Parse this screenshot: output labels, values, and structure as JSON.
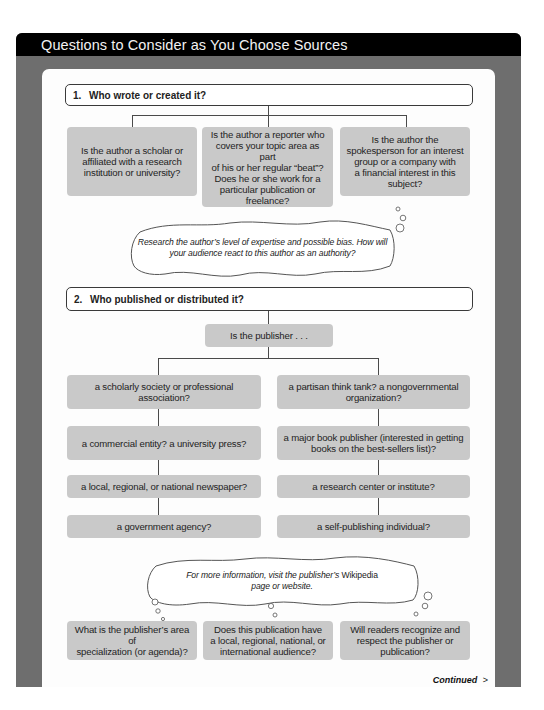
{
  "header": {
    "title": "Questions to Consider as You Choose Sources"
  },
  "section1": {
    "number": "1.",
    "title": "Who wrote or created it?",
    "questions": [
      "Is the author a scholar or\naffiliated with a research\ninstitution or university?",
      "Is the author a reporter who\ncovers your topic area as part\nof his or her regular “beat”?\nDoes he or she work for a\nparticular publication or\nfreelance?",
      "Is the author the\nspokesperson for an interest\ngroup or a company with\na financial interest in this\nsubject?"
    ],
    "thought": {
      "line1": "Research the author’s level of expertise and possible bias. How will",
      "line2": "your audience react to this author as an authority?"
    }
  },
  "section2": {
    "number": "2.",
    "title": "Who published or distributed it?",
    "prompt": "Is the publisher . . .",
    "options_left": [
      "a scholarly society or professional\nassociation?",
      "a commercial entity? a university press?",
      "a local, regional, or national newspaper?",
      "a government agency?"
    ],
    "options_right": [
      "a partisan think tank? a nongovernmental\norganization?",
      "a major book publisher (interested in getting\nbooks on the best-sellers list)?",
      "a research center or institute?",
      "a self-publishing individual?"
    ],
    "thought": {
      "line1_prefix": "For more information, visit the publisher’s ",
      "line1_emphasis": "Wikipedia",
      "line2": "page or website."
    },
    "follow_up_questions": [
      "What is the publisher’s area of\nspecialization (or agenda)?",
      "Does this publication have\na local, regional, national, or\ninternational audience?",
      "Will readers recognize and\nrespect the publisher or\npublication?"
    ]
  },
  "footer": {
    "continued_label": "Continued",
    "continued_icon": "chevron-right-icon",
    "continued_glyph": ">"
  },
  "colors": {
    "header_bg": "#000000",
    "frame_gray": "#6e6e6e",
    "box_gray": "#c9c9c9",
    "line": "#4a4a4a"
  }
}
